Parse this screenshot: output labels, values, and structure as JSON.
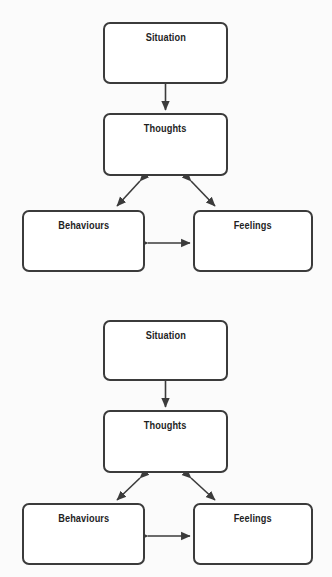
{
  "document": {
    "title": "Cognitive Behavioural Model",
    "background_color": "#fbfbfb",
    "border_color": "#3b3b3b",
    "text_color": "#1f1f1f",
    "arrow_color": "#3b3b3b"
  },
  "diagrams": [
    {
      "id": "diagram-1",
      "nodes": {
        "situation": "Situation",
        "thoughts": "Thoughts",
        "behaviours": "Behaviours",
        "feelings": "Feelings"
      },
      "connections": [
        {
          "from": "situation",
          "to": "thoughts",
          "type": "single-arrow",
          "direction": "down"
        },
        {
          "from": "thoughts",
          "to": "behaviours",
          "type": "double-arrow",
          "direction": "diagonal-left"
        },
        {
          "from": "thoughts",
          "to": "feelings",
          "type": "double-arrow",
          "direction": "diagonal-right"
        },
        {
          "from": "behaviours",
          "to": "feelings",
          "type": "double-arrow",
          "direction": "horizontal"
        }
      ]
    },
    {
      "id": "diagram-2",
      "nodes": {
        "situation": "Situation",
        "thoughts": "Thoughts",
        "behaviours": "Behaviours",
        "feelings": "Feelings"
      },
      "connections": [
        {
          "from": "situation",
          "to": "thoughts",
          "type": "single-arrow",
          "direction": "down"
        },
        {
          "from": "thoughts",
          "to": "behaviours",
          "type": "double-arrow",
          "direction": "diagonal-left"
        },
        {
          "from": "thoughts",
          "to": "feelings",
          "type": "double-arrow",
          "direction": "diagonal-right"
        },
        {
          "from": "behaviours",
          "to": "feelings",
          "type": "double-arrow",
          "direction": "horizontal"
        }
      ]
    }
  ]
}
